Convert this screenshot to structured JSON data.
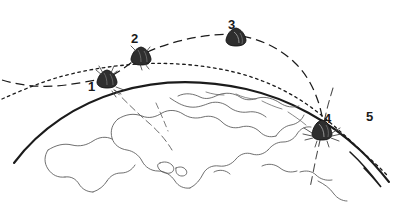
{
  "figure": {
    "background_color": "#ffffff",
    "ink_color": "#1b1b1b",
    "coastline_color": "#4a4a4a"
  },
  "stages": [
    {
      "id": "1",
      "label": "1",
      "icon": "capsule-icon",
      "x": 107,
      "y": 78,
      "label_x": 88,
      "label_y": 80,
      "note": "capsule on lower dashed arc with attached antenna ticks"
    },
    {
      "id": "2",
      "label": "2",
      "icon": "capsule-icon",
      "x": 141,
      "y": 55,
      "label_x": 131,
      "label_y": 32,
      "note": "capsule on ascending dashed arc"
    },
    {
      "id": "3",
      "label": "3",
      "icon": "capsule-icon",
      "x": 236,
      "y": 35,
      "label_x": 228,
      "label_y": 18,
      "note": "capsule at apex of dashed arc"
    },
    {
      "id": "4",
      "label": "4",
      "icon": "capsule-descending-icon",
      "x": 322,
      "y": 128,
      "label_x": 324,
      "label_y": 112,
      "note": "capsule descending through Earth limb on long-dashed line"
    },
    {
      "id": "5",
      "label": "5",
      "icon": "none",
      "x": 370,
      "y": 118,
      "label_x": 366,
      "label_y": 110,
      "note": "label for the fine dotted trajectory leaving frame lower right"
    }
  ],
  "trajectories": [
    {
      "name": "dashed-trajectory",
      "style": "long-dash",
      "stroke_width": 1.2,
      "color": "#1b1b1b",
      "passes_through_stages": [
        "1",
        "2",
        "3",
        "4"
      ]
    },
    {
      "name": "dotted-trajectory",
      "style": "fine-dot",
      "stroke_width": 1.2,
      "color": "#1b1b1b",
      "passes_through_stages": [
        "5"
      ]
    },
    {
      "name": "descent-line",
      "style": "dash",
      "stroke_width": 1.0,
      "color": "#4a4a4a",
      "passes_through_stages": [
        "4"
      ]
    },
    {
      "name": "sightline-stage-1",
      "style": "thin-dash",
      "stroke_width": 0.8,
      "color": "#4a4a4a",
      "passes_through_stages": [
        "1"
      ]
    }
  ],
  "earth": {
    "name": "earth-limb",
    "limb_stroke_width": 2.0,
    "limb_color": "#1b1b1b",
    "coastlines_visible": true
  }
}
